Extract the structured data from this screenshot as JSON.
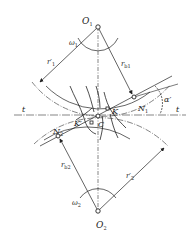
{
  "diagram": {
    "labels": {
      "O1": "O",
      "O1_sub": "1",
      "O2": "O",
      "O2_sub": "2",
      "omega1": "ω",
      "omega1_sub": "1",
      "omega2": "ω",
      "omega2_sub": "2",
      "r1_pitch": "r′",
      "r1_pitch_sub": "1",
      "r2_pitch": "r′",
      "r2_pitch_sub": "2",
      "rb1": "r",
      "rb1_sub": "b1",
      "rb2": "r",
      "rb2_sub": "b2",
      "N1": "N",
      "N1_sub": "1",
      "N2": "N",
      "N2_sub": "2",
      "K": "K",
      "K_prime": "K′",
      "C": "C",
      "alpha": "α′",
      "t_left": "t",
      "t_right": "t"
    },
    "points": {
      "O1": [
        98,
        27
      ],
      "O2": [
        98,
        211
      ],
      "C": [
        98,
        116
      ],
      "N1": [
        134,
        97
      ],
      "N2": [
        58,
        136
      ],
      "K": [
        107,
        108
      ],
      "K_prime": [
        91,
        123
      ]
    },
    "colors": {
      "stroke": "#222222",
      "background": "#ffffff"
    }
  }
}
